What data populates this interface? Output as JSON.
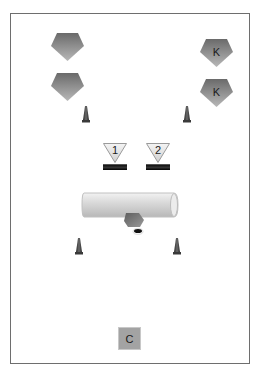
{
  "diagram": {
    "type": "drill-layout",
    "frame_color": "#6e6e6e",
    "shape_fill_dark": "#6f6f6f",
    "shape_fill_light": "#b5b5b5",
    "pentagons": [
      {
        "id": "p1",
        "label": "",
        "x": 51,
        "y": 32
      },
      {
        "id": "p2",
        "label": "",
        "x": 51,
        "y": 72
      },
      {
        "id": "p3",
        "label": "K",
        "x": 200,
        "y": 38
      },
      {
        "id": "p4",
        "label": "K",
        "x": 200,
        "y": 78
      }
    ],
    "cones": [
      {
        "id": "c1",
        "x": 82,
        "y": 106
      },
      {
        "id": "c2",
        "x": 183,
        "y": 106
      },
      {
        "id": "c3",
        "x": 75,
        "y": 238
      },
      {
        "id": "c4",
        "x": 173,
        "y": 238
      }
    ],
    "markers": [
      {
        "id": "m1",
        "label": "1",
        "x": 103,
        "y": 143
      },
      {
        "id": "m2",
        "label": "2",
        "x": 146,
        "y": 143
      }
    ],
    "tube": {
      "label": "",
      "x": 81,
      "y": 192,
      "width": 97,
      "height": 24
    },
    "coach": {
      "label": "C"
    }
  }
}
